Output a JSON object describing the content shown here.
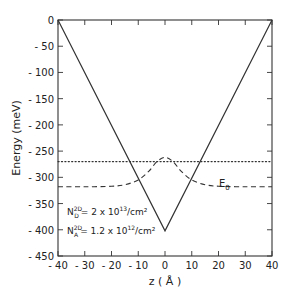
{
  "chart_data": {
    "type": "line",
    "title": "",
    "xlabel": "z ( Å )",
    "ylabel": "Energy  (meV)",
    "xlim": [
      -40,
      40
    ],
    "ylim": [
      -450,
      0
    ],
    "xticks": [
      -40,
      -30,
      -20,
      -10,
      0,
      10,
      20,
      30,
      40
    ],
    "yticks": [
      0,
      -50,
      -100,
      -150,
      -200,
      -250,
      -300,
      -350,
      -400,
      -450
    ],
    "grid": false,
    "series": [
      {
        "name": "potential (V-shaped well)",
        "style": "solid",
        "x": [
          -40,
          0,
          40
        ],
        "y": [
          0,
          -402,
          0
        ]
      },
      {
        "name": "Fermi level",
        "style": "dotted",
        "x": [
          -40,
          40
        ],
        "y": [
          -270,
          -270
        ]
      },
      {
        "name": "E0 wavefunction",
        "style": "dashed",
        "x": [
          -40,
          -30,
          -20,
          -15,
          -10,
          -6,
          -3,
          0,
          3,
          6,
          10,
          15,
          20,
          30,
          40
        ],
        "y": [
          -318,
          -318,
          -317,
          -314,
          -305,
          -288,
          -270,
          -262,
          -270,
          -288,
          -305,
          -314,
          -317,
          -318,
          -318
        ]
      }
    ],
    "annotations": [
      {
        "text": "E",
        "sub": "0",
        "x": 18,
        "y": -300
      },
      {
        "line": 1,
        "text_main": "N",
        "sup": "2D",
        "sub": "D",
        "rest": "= 2 x 10",
        "exp": "13",
        "unit": "/cm²",
        "x": -37,
        "y": -370
      },
      {
        "line": 2,
        "text_main": "N",
        "sup": "2D",
        "sub": "A",
        "rest": "= 1.2 x 10",
        "exp": "12",
        "unit": "/cm²",
        "x": -37,
        "y": -405
      }
    ]
  },
  "labels": {
    "xlabel": "z ( Å )",
    "ylabel": "Energy  (meV)",
    "e0": "E",
    "e0_sub": "0",
    "nd_main": "N",
    "nd_sup": "2D",
    "nd_sub": "D",
    "nd_rest": "= 2 x 10",
    "nd_exp": "13",
    "nd_unit": "/cm²",
    "na_main": "N",
    "na_sup": "2D",
    "na_sub": "A",
    "na_rest": "= 1.2 x 10",
    "na_exp": "12",
    "na_unit": "/cm²"
  }
}
